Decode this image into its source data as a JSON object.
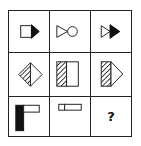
{
  "puzzle": {
    "type": "3x3 matrix reasoning puzzle",
    "rows": [
      {
        "cells": [
          {
            "id": "r1c1",
            "description": "white square joined to black right-pointing triangle"
          },
          {
            "id": "r1c2",
            "description": "white right-pointing triangle joined to white circle"
          },
          {
            "id": "r1c3",
            "description": "white right-pointing triangle joined to black right-pointing triangle"
          }
        ]
      },
      {
        "cells": [
          {
            "id": "r2c1",
            "description": "diamond with hatched left half and white right half"
          },
          {
            "id": "r2c2",
            "description": "hatched rectangle joined to white rectangle"
          },
          {
            "id": "r2c3",
            "description": "hatched rectangle joined to white right-pointing triangle"
          }
        ]
      },
      {
        "cells": [
          {
            "id": "r3c1",
            "description": "tall black rectangle with white horizontal rectangle at top right"
          },
          {
            "id": "r3c2",
            "description": "small white square joined to white horizontal rectangle"
          },
          {
            "id": "r3c3",
            "description": "unknown",
            "label": "?"
          }
        ]
      }
    ]
  },
  "colors": {
    "stroke": "#222222",
    "fill_black": "#111111",
    "fill_white": "#ffffff",
    "background": "#ffffff"
  }
}
